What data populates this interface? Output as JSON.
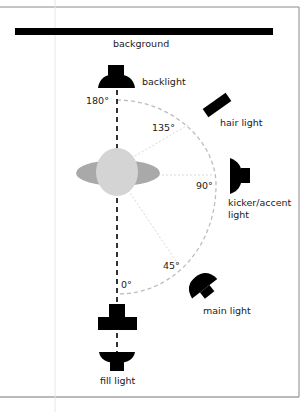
{
  "diagram": {
    "type": "lighting-setup-top-view",
    "labels": {
      "background": "background",
      "backlight": "backlight",
      "hair_light": "hair light",
      "kicker_line1": "kicker/accent",
      "kicker_line2": "light",
      "main_light": "main light",
      "fill_light": "fill light"
    },
    "angles": {
      "a180": "180°",
      "a135": "135°",
      "a90": "90°",
      "a45": "45°",
      "a0": "0°"
    },
    "colors": {
      "ink": "#000000",
      "head": "#d4d4d4",
      "shoulders": "#a9a9a9",
      "arc": "#bdbdbd",
      "frame": "#888888"
    }
  }
}
